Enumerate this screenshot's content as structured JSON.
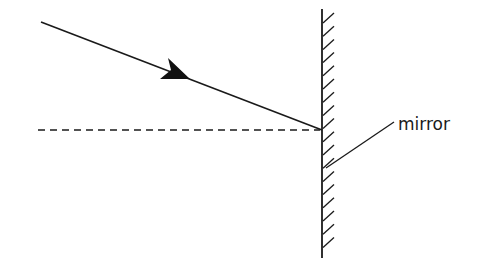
{
  "diagram": {
    "type": "ray-reflection",
    "labels": {
      "mirror": "mirror"
    },
    "elements": {
      "incident_ray": {
        "x1": 41,
        "y1": 22,
        "x2": 322,
        "y2": 130,
        "arrow_at": [
          181,
          76
        ]
      },
      "normal_line": {
        "x1": 38,
        "y1": 130,
        "x2": 322,
        "y2": 130,
        "style": "dashed"
      },
      "mirror": {
        "x": 322,
        "y_top": 9,
        "y_bottom": 258,
        "hatch_side": "right"
      },
      "leader_line": {
        "x1": 394,
        "y1": 122,
        "x2": 326,
        "y2": 168
      }
    },
    "colors": {
      "stroke": "#1a1a1a",
      "background": "#ffffff"
    }
  }
}
